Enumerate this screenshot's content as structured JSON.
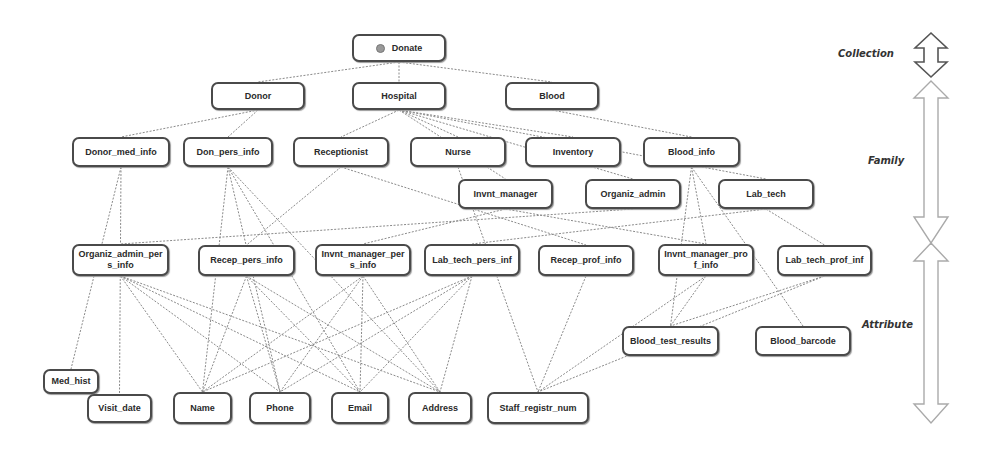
{
  "diagram": {
    "levels": [
      {
        "id": "collection",
        "label": "Collection",
        "x": 838,
        "y": 50
      },
      {
        "id": "family",
        "label": "Family",
        "x": 868,
        "y": 157
      },
      {
        "id": "attribute",
        "label": "Attribute",
        "x": 862,
        "y": 321
      }
    ],
    "nodes": [
      {
        "id": "donate",
        "label": "Donate",
        "x": 352,
        "y": 34,
        "w": 94,
        "h": 28,
        "root": true
      },
      {
        "id": "donor",
        "label": "Donor",
        "x": 211,
        "y": 82,
        "w": 94,
        "h": 28
      },
      {
        "id": "hospital",
        "label": "Hospital",
        "x": 352,
        "y": 82,
        "w": 94,
        "h": 28
      },
      {
        "id": "blood",
        "label": "Blood",
        "x": 505,
        "y": 82,
        "w": 94,
        "h": 28
      },
      {
        "id": "donor_med_info",
        "label": "Donor_med_info",
        "x": 72,
        "y": 137,
        "w": 98,
        "h": 30
      },
      {
        "id": "don_pers_info",
        "label": "Don_pers_info",
        "x": 183,
        "y": 137,
        "w": 90,
        "h": 30
      },
      {
        "id": "receptionist",
        "label": "Receptionist",
        "x": 293,
        "y": 137,
        "w": 96,
        "h": 30
      },
      {
        "id": "nurse",
        "label": "Nurse",
        "x": 410,
        "y": 137,
        "w": 96,
        "h": 30
      },
      {
        "id": "inventory",
        "label": "Inventory",
        "x": 525,
        "y": 137,
        "w": 96,
        "h": 30
      },
      {
        "id": "blood_info",
        "label": "Blood_info",
        "x": 643,
        "y": 137,
        "w": 97,
        "h": 30
      },
      {
        "id": "invnt_manager",
        "label": "Invnt_manager",
        "x": 458,
        "y": 179,
        "w": 95,
        "h": 30
      },
      {
        "id": "organiz_admin",
        "label": "Organiz_admin",
        "x": 585,
        "y": 179,
        "w": 96,
        "h": 30
      },
      {
        "id": "lab_tech",
        "label": "Lab_tech",
        "x": 718,
        "y": 179,
        "w": 96,
        "h": 30
      },
      {
        "id": "organiz_admin_pers_info",
        "label": "Organiz_admin_pers_info",
        "x": 72,
        "y": 244,
        "w": 97,
        "h": 32
      },
      {
        "id": "recep_pers_info",
        "label": "Recep_pers_info",
        "x": 198,
        "y": 245,
        "w": 97,
        "h": 31
      },
      {
        "id": "invnt_manager_pers_info",
        "label": "Invnt_manager_pers_info",
        "x": 315,
        "y": 244,
        "w": 96,
        "h": 32
      },
      {
        "id": "lab_tech_pers_inf",
        "label": "Lab_tech_pers_inf",
        "x": 424,
        "y": 244,
        "w": 96,
        "h": 32
      },
      {
        "id": "recep_prof_info",
        "label": "Recep_prof_info",
        "x": 538,
        "y": 245,
        "w": 96,
        "h": 31
      },
      {
        "id": "invnt_manager_prof_info",
        "label": "Invnt_manager_prof_info",
        "x": 658,
        "y": 244,
        "w": 96,
        "h": 32
      },
      {
        "id": "lab_tech_prof_inf",
        "label": "Lab_tech_prof_inf",
        "x": 777,
        "y": 245,
        "w": 95,
        "h": 31
      },
      {
        "id": "blood_test_results",
        "label": "Blood_test_results",
        "x": 622,
        "y": 326,
        "w": 97,
        "h": 30
      },
      {
        "id": "blood_barcode",
        "label": "Blood_barcode",
        "x": 755,
        "y": 326,
        "w": 96,
        "h": 30
      },
      {
        "id": "med_hist",
        "label": "Med_hist",
        "x": 43,
        "y": 369,
        "w": 56,
        "h": 25
      },
      {
        "id": "visit_date",
        "label": "Visit_date",
        "x": 87,
        "y": 394,
        "w": 65,
        "h": 29
      },
      {
        "id": "name",
        "label": "Name",
        "x": 173,
        "y": 392,
        "w": 59,
        "h": 32
      },
      {
        "id": "phone",
        "label": "Phone",
        "x": 249,
        "y": 392,
        "w": 62,
        "h": 32
      },
      {
        "id": "email",
        "label": "Email",
        "x": 331,
        "y": 392,
        "w": 58,
        "h": 32
      },
      {
        "id": "address",
        "label": "Address",
        "x": 408,
        "y": 392,
        "w": 64,
        "h": 32
      },
      {
        "id": "staff_registr_num",
        "label": "Staff_registr_num",
        "x": 487,
        "y": 392,
        "w": 102,
        "h": 32
      }
    ],
    "edges": [
      [
        "donate",
        "donor"
      ],
      [
        "donate",
        "hospital"
      ],
      [
        "donate",
        "blood"
      ],
      [
        "donor",
        "donor_med_info"
      ],
      [
        "donor",
        "don_pers_info"
      ],
      [
        "hospital",
        "receptionist"
      ],
      [
        "hospital",
        "nurse"
      ],
      [
        "hospital",
        "inventory"
      ],
      [
        "hospital",
        "invnt_manager"
      ],
      [
        "hospital",
        "organiz_admin"
      ],
      [
        "hospital",
        "lab_tech"
      ],
      [
        "blood",
        "blood_info"
      ],
      [
        "donor_med_info",
        "med_hist"
      ],
      [
        "donor_med_info",
        "visit_date"
      ],
      [
        "don_pers_info",
        "name"
      ],
      [
        "don_pers_info",
        "phone"
      ],
      [
        "don_pers_info",
        "email"
      ],
      [
        "don_pers_info",
        "address"
      ],
      [
        "receptionist",
        "recep_pers_info"
      ],
      [
        "receptionist",
        "recep_prof_info"
      ],
      [
        "nurse",
        "staff_registr_num"
      ],
      [
        "invnt_manager",
        "invnt_manager_pers_info"
      ],
      [
        "invnt_manager",
        "invnt_manager_prof_info"
      ],
      [
        "organiz_admin",
        "organiz_admin_pers_info"
      ],
      [
        "lab_tech",
        "lab_tech_pers_inf"
      ],
      [
        "lab_tech",
        "lab_tech_prof_inf"
      ],
      [
        "blood_info",
        "blood_test_results"
      ],
      [
        "blood_info",
        "blood_barcode"
      ],
      [
        "blood_info",
        "invnt_manager_prof_info"
      ],
      [
        "organiz_admin_pers_info",
        "name"
      ],
      [
        "organiz_admin_pers_info",
        "phone"
      ],
      [
        "organiz_admin_pers_info",
        "email"
      ],
      [
        "organiz_admin_pers_info",
        "address"
      ],
      [
        "recep_pers_info",
        "name"
      ],
      [
        "recep_pers_info",
        "phone"
      ],
      [
        "recep_pers_info",
        "email"
      ],
      [
        "recep_pers_info",
        "address"
      ],
      [
        "invnt_manager_pers_info",
        "name"
      ],
      [
        "invnt_manager_pers_info",
        "phone"
      ],
      [
        "invnt_manager_pers_info",
        "email"
      ],
      [
        "invnt_manager_pers_info",
        "address"
      ],
      [
        "lab_tech_pers_inf",
        "name"
      ],
      [
        "lab_tech_pers_inf",
        "phone"
      ],
      [
        "lab_tech_pers_inf",
        "email"
      ],
      [
        "lab_tech_pers_inf",
        "address"
      ],
      [
        "recep_prof_info",
        "staff_registr_num"
      ],
      [
        "invnt_manager_prof_info",
        "staff_registr_num"
      ],
      [
        "invnt_manager_prof_info",
        "blood_test_results"
      ],
      [
        "lab_tech_prof_inf",
        "staff_registr_num"
      ],
      [
        "lab_tech_prof_inf",
        "blood_test_results"
      ]
    ],
    "colors": {
      "edge": "#8a8a8a",
      "node_border": "#4a4a4a",
      "arrow": "#8a8a8a",
      "collection_arrow": "#555555"
    }
  }
}
